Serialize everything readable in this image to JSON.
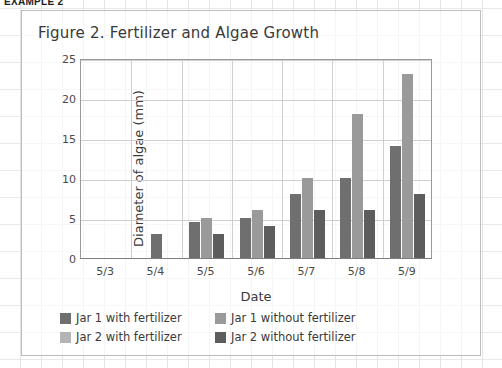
{
  "example_label": "EXAMPLE 2",
  "chart_data": {
    "type": "bar",
    "title": "Figure 2. Fertilizer and Algae Growth",
    "xlabel": "Date",
    "ylabel": "Diameter of algae (mm)",
    "categories": [
      "5/3",
      "5/4",
      "5/5",
      "5/6",
      "5/7",
      "5/8",
      "5/9"
    ],
    "ylim": [
      0,
      25
    ],
    "yticks": [
      0,
      5,
      10,
      15,
      20,
      25
    ],
    "grid": true,
    "legend_position": "bottom",
    "series": [
      {
        "name": "Jar 1 with fertilizer",
        "color": "#6f6f6f",
        "values": [
          0,
          3,
          4.5,
          5,
          8,
          10,
          14
        ]
      },
      {
        "name": "Jar 1 without fertilizer",
        "color": "#9a9a9a",
        "values": [
          0,
          0,
          5,
          6,
          10,
          18,
          23
        ]
      },
      {
        "name": "Jar 2 with fertilizer",
        "color": "#b4b4b4",
        "values": [
          0,
          0,
          0,
          0,
          0,
          0,
          0
        ]
      },
      {
        "name": "Jar 2 without fertilizer",
        "color": "#5d5d5d",
        "values": [
          0,
          0,
          3,
          4,
          6,
          6,
          8
        ]
      }
    ]
  },
  "colors": {
    "frame_border": "#bdbdbd",
    "axis": "#9a9a9a",
    "gridline": "#cfcfcf",
    "text": "#3a3a3a"
  }
}
